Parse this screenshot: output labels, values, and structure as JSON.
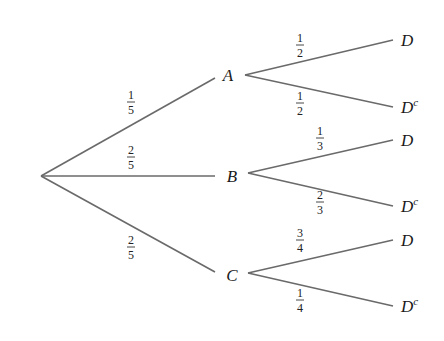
{
  "diagram": {
    "type": "probability-tree",
    "root": {
      "x": 41,
      "y": 176
    },
    "first_stage": [
      {
        "label": "A",
        "prob_num": "1",
        "prob_den": "5",
        "node_x": 228,
        "node_y": 81,
        "edge_end_x": 215,
        "edge_end_y": 78,
        "frac_x": 131,
        "frac_y": 102
      },
      {
        "label": "B",
        "prob_num": "2",
        "prob_den": "5",
        "node_x": 232,
        "node_y": 182,
        "edge_end_x": 215,
        "edge_end_y": 176,
        "frac_x": 131,
        "frac_y": 157
      },
      {
        "label": "C",
        "prob_num": "2",
        "prob_den": "5",
        "node_x": 232,
        "node_y": 281,
        "edge_end_x": 215,
        "edge_end_y": 272,
        "frac_x": 131,
        "frac_y": 247
      }
    ],
    "second_stage": [
      {
        "parent": "A",
        "label": "D",
        "superscript": "",
        "prob_num": "1",
        "prob_den": "2",
        "start_x": 245,
        "start_y": 75,
        "end_x": 393,
        "end_y": 40,
        "label_x": 401,
        "label_y": 46,
        "frac_x": 300,
        "frac_y": 45
      },
      {
        "parent": "A",
        "label": "D",
        "superscript": "c",
        "prob_num": "1",
        "prob_den": "2",
        "start_x": 245,
        "start_y": 75,
        "end_x": 393,
        "end_y": 107,
        "label_x": 401,
        "label_y": 113,
        "frac_x": 300,
        "frac_y": 103
      },
      {
        "parent": "B",
        "label": "D",
        "superscript": "",
        "prob_num": "1",
        "prob_den": "3",
        "start_x": 248,
        "start_y": 173,
        "end_x": 393,
        "end_y": 140,
        "label_x": 401,
        "label_y": 146,
        "frac_x": 320,
        "frac_y": 138
      },
      {
        "parent": "B",
        "label": "D",
        "superscript": "c",
        "prob_num": "2",
        "prob_den": "3",
        "start_x": 248,
        "start_y": 173,
        "end_x": 393,
        "end_y": 206,
        "label_x": 401,
        "label_y": 212,
        "frac_x": 320,
        "frac_y": 202
      },
      {
        "parent": "C",
        "label": "D",
        "superscript": "",
        "prob_num": "3",
        "prob_den": "4",
        "start_x": 248,
        "start_y": 273,
        "end_x": 393,
        "end_y": 240,
        "label_x": 401,
        "label_y": 246,
        "frac_x": 300,
        "frac_y": 240
      },
      {
        "parent": "C",
        "label": "D",
        "superscript": "c",
        "prob_num": "1",
        "prob_den": "4",
        "start_x": 248,
        "start_y": 273,
        "end_x": 393,
        "end_y": 306,
        "label_x": 401,
        "label_y": 312,
        "frac_x": 300,
        "frac_y": 300
      }
    ]
  },
  "colors": {
    "background": "#ffffff",
    "edge": "#6a6a6a",
    "text": "#1a1a1a"
  }
}
